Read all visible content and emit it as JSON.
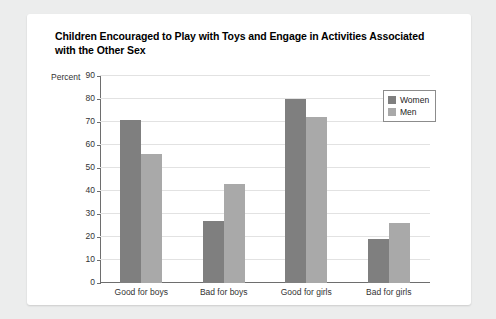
{
  "card": {
    "title": "Children Encouraged to Play with Toys and Engage in Activities Associated with the Other Sex",
    "source_note": "Data from Parker et al., 2017"
  },
  "chart_data": {
    "type": "bar",
    "title": "Children Encouraged to Play with Toys and Engage in Activities Associated with the Other Sex",
    "categories": [
      "Good for boys",
      "Bad for boys",
      "Good for girls",
      "Bad for girls"
    ],
    "series": [
      {
        "name": "Women",
        "color": "#7f7f7f",
        "values": [
          71,
          27,
          80,
          19
        ]
      },
      {
        "name": "Men",
        "color": "#a9a9a9",
        "values": [
          56,
          43,
          72,
          26
        ]
      }
    ],
    "xlabel": "",
    "ylabel": "Percent",
    "ylim": [
      0,
      90
    ],
    "yticks": [
      0,
      10,
      20,
      30,
      40,
      50,
      60,
      70,
      80,
      90
    ],
    "ytick_labels": [
      "0",
      "10",
      "20",
      "30",
      "40",
      "50",
      "60",
      "70",
      "80",
      "90"
    ],
    "grid": true,
    "legend_position": "top-right",
    "source": "Data from Parker et al., 2017"
  }
}
